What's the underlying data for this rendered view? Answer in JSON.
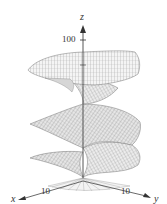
{
  "figure": {
    "type": "3d-surface-plot",
    "colors": {
      "background": "#ffffff",
      "axis": "#333333",
      "mesh": "#8a8a8a",
      "surface_fill": "#f2f2f2",
      "surface_shade": "#d8d8d8"
    }
  },
  "axes": {
    "z": {
      "label": "z",
      "tick": "100"
    },
    "x": {
      "label": "x",
      "tick": "10"
    },
    "y": {
      "label": "y",
      "tick": "10"
    }
  }
}
